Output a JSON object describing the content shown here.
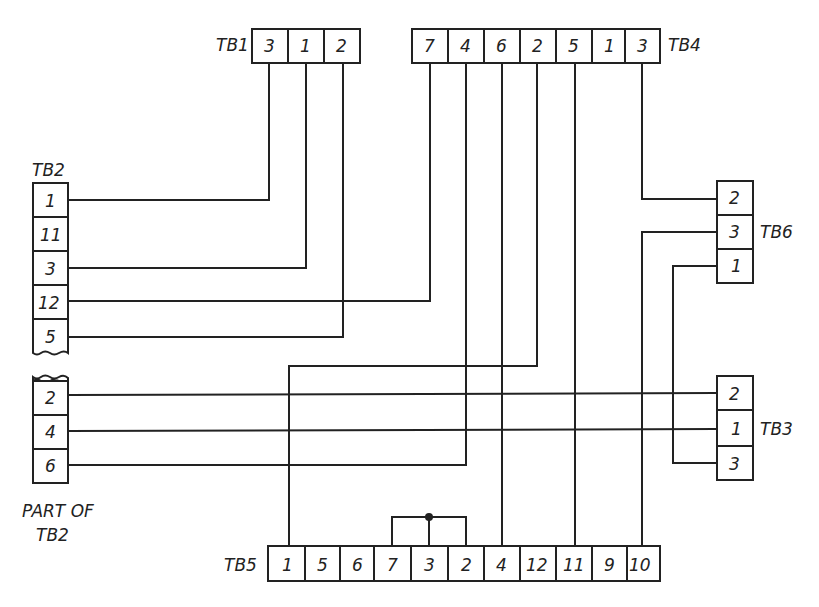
{
  "diagram": {
    "type": "terminal-block wiring diagram",
    "colors": {
      "line": "#222222",
      "background": "#ffffff"
    },
    "terminal_blocks": [
      {
        "id": "TB1",
        "label": "TB1",
        "orientation": "horizontal",
        "terminals": [
          "3",
          "1",
          "2"
        ]
      },
      {
        "id": "TB4",
        "label": "TB4",
        "orientation": "horizontal",
        "terminals": [
          "7",
          "4",
          "6",
          "2",
          "5",
          "1",
          "3"
        ]
      },
      {
        "id": "TB2",
        "label": "TB2",
        "orientation": "vertical",
        "terminals": [
          "1",
          "11",
          "3",
          "12",
          "5"
        ]
      },
      {
        "id": "TB2_part",
        "label": "PART OF",
        "label2": "TB2",
        "orientation": "vertical",
        "terminals": [
          "2",
          "4",
          "6"
        ]
      },
      {
        "id": "TB6",
        "label": "TB6",
        "orientation": "vertical",
        "terminals": [
          "2",
          "3",
          "1"
        ]
      },
      {
        "id": "TB3",
        "label": "TB3",
        "orientation": "vertical",
        "terminals": [
          "2",
          "1",
          "3"
        ]
      },
      {
        "id": "TB5",
        "label": "TB5",
        "orientation": "horizontal",
        "terminals": [
          "1",
          "5",
          "6",
          "7",
          "3",
          "2",
          "4",
          "12",
          "11",
          "9",
          "10"
        ]
      }
    ],
    "connections": [
      {
        "from": "TB1-3",
        "to": "TB2-1"
      },
      {
        "from": "TB1-1",
        "to": "TB2-3"
      },
      {
        "from": "TB1-2",
        "to": "TB2-5"
      },
      {
        "from": "TB4-7",
        "to": "TB2-12"
      },
      {
        "from": "TB4-4",
        "to": "TB2-6"
      },
      {
        "from": "TB4-6",
        "to": "TB5-4"
      },
      {
        "from": "TB4-2",
        "to": "TB5-1"
      },
      {
        "from": "TB4-5",
        "to": "TB5-11"
      },
      {
        "from": "TB4-3",
        "to": "TB6-2"
      },
      {
        "from": "TB6-3",
        "to": "TB5-10"
      },
      {
        "from": "TB6-1",
        "to": "TB3-3"
      },
      {
        "from": "TB2-2",
        "to": "TB3-2"
      },
      {
        "from": "TB2-4",
        "to": "TB3-1"
      },
      {
        "from": "TB5-7",
        "to": "TB5-3",
        "type": "jumper"
      },
      {
        "from": "TB5-3",
        "to": "TB5-2",
        "type": "jumper"
      }
    ],
    "unconnected": [
      "TB2-11",
      "TB4-1",
      "TB5-5",
      "TB5-6",
      "TB5-12",
      "TB5-9"
    ]
  }
}
